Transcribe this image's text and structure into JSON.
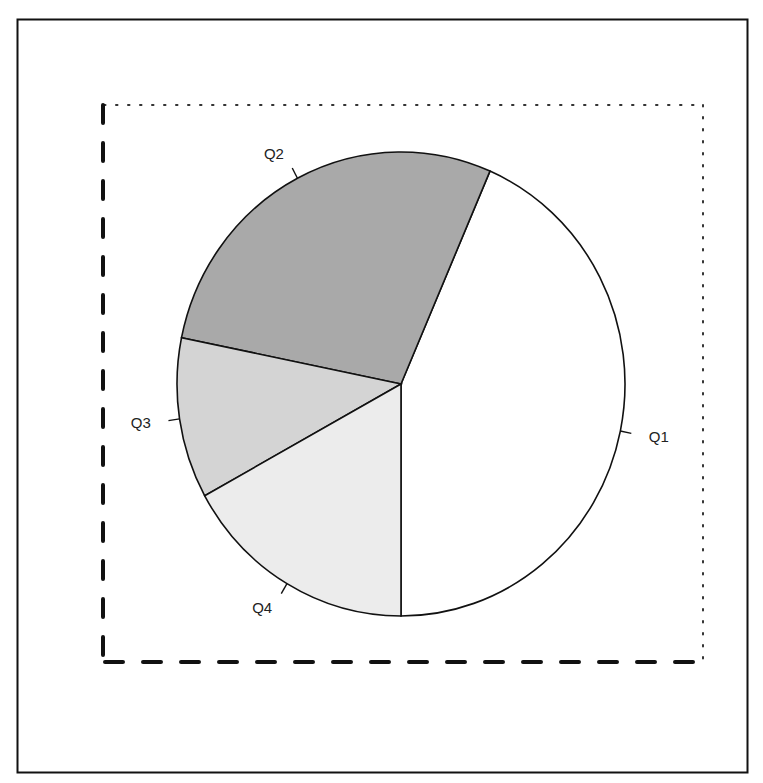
{
  "chart_data": {
    "type": "pie",
    "title": "",
    "categories": [
      "Q1",
      "Q2",
      "Q3",
      "Q4"
    ],
    "values": [
      43.5,
      28.3,
      11.2,
      17.0
    ],
    "colors": [
      "#ffffff",
      "#a9a9a9",
      "#d4d4d4",
      "#ececec"
    ],
    "start_angle_deg": 180,
    "direction": "counterclockwise-from-bottom",
    "legend": "none",
    "labels_outside": true
  },
  "frame": {
    "outer_border_color": "#111111",
    "panel_left_bottom_style": "dashed",
    "panel_top_right_style": "dotted"
  }
}
